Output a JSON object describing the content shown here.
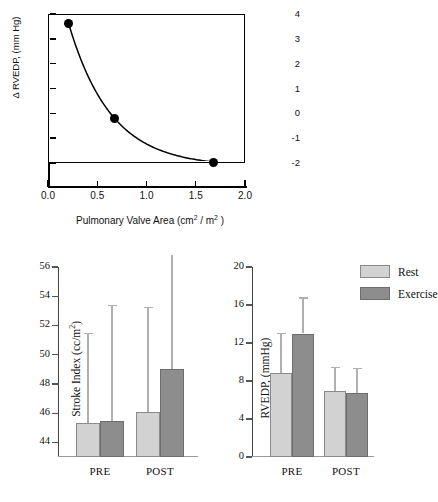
{
  "chart_data": [
    {
      "type": "line",
      "panel": "top",
      "title": "",
      "xlabel": "Pulmonary Valve Area (cm² / m²)",
      "ylabel": "Δ RVEDP, (mm Hg)",
      "xlabel_parts": {
        "pre": "Pulmonary Valve Area (cm",
        "sup1": "2",
        "mid": " / m",
        "sup2": "2",
        "post": " )"
      },
      "xlim": [
        0.0,
        2.0
      ],
      "ylim": [
        -2.6,
        4.0
      ],
      "xticks": [
        0.0,
        0.5,
        1.0,
        1.5,
        2.0
      ],
      "xticklabels": [
        "0.0",
        "0.5",
        "1.0",
        "1.5",
        "2.0"
      ],
      "yticks": [
        4,
        3,
        2,
        1,
        0,
        -1,
        -2
      ],
      "yticklabels": [
        "4",
        "3",
        "2",
        "1",
        "0",
        "-1",
        "-2"
      ],
      "grid": false,
      "legend": "none",
      "marker": "filled-circle",
      "x": [
        0.2,
        0.67,
        1.67
      ],
      "y": [
        3.65,
        -0.18,
        -1.92
      ]
    },
    {
      "type": "bar",
      "panel": "bottom-left",
      "title": "",
      "xlabel": "",
      "ylabel": "Stroke Index (cc/m²)",
      "ylabel_parts": {
        "pre": "Stroke Index (cc/m",
        "sup": "2",
        "post": ")"
      },
      "categories": [
        "PRE",
        "POST"
      ],
      "ylim": [
        43.0,
        56.0
      ],
      "yticks": [
        44,
        46,
        48,
        50,
        52,
        54,
        56
      ],
      "yticklabels": [
        "44",
        "46",
        "48",
        "50",
        "52",
        "54",
        "56"
      ],
      "grid": false,
      "legend": "none",
      "errorbars": "upper-only",
      "series": [
        {
          "name": "Rest",
          "color": "#d2d2d2",
          "values": [
            45.35,
            46.1
          ],
          "err_top": [
            51.5,
            53.25
          ]
        },
        {
          "name": "Exercise",
          "color": "#8d8d8d",
          "values": [
            45.45,
            49.0
          ],
          "err_top": [
            53.4,
            57.2
          ]
        }
      ]
    },
    {
      "type": "bar",
      "panel": "bottom-right",
      "title": "",
      "xlabel": "",
      "ylabel": "RVEDP, (mmHg)",
      "categories": [
        "PRE",
        "POST"
      ],
      "ylim": [
        0,
        20
      ],
      "yticks": [
        0,
        4,
        8,
        12,
        16,
        20
      ],
      "yticklabels": [
        "0",
        "4",
        "8",
        "12",
        "16",
        "20"
      ],
      "grid": false,
      "legend": "top-right",
      "legend_entries": [
        "Rest",
        "Exercise"
      ],
      "errorbars": "upper-only",
      "series": [
        {
          "name": "Rest",
          "color": "#d2d2d2",
          "values": [
            8.8,
            6.9
          ],
          "err_top": [
            13.1,
            9.5
          ]
        },
        {
          "name": "Exercise",
          "color": "#8d8d8d",
          "values": [
            13.0,
            6.7
          ],
          "err_top": [
            16.8,
            9.4
          ]
        }
      ]
    }
  ],
  "legend": {
    "rest_label": "Rest",
    "exercise_label": "Exercise"
  },
  "colors": {
    "rest": "#d2d2d2",
    "exercise": "#8d8d8d",
    "axis": "#444444",
    "marker": "#000000",
    "errorbar": "#b0b0b0"
  }
}
